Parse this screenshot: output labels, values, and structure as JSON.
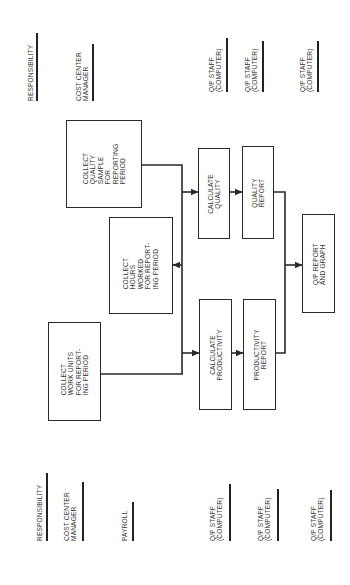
{
  "orientation": "rotated-90-ccw",
  "colors": {
    "line": "#2a2a2a",
    "text": "#333333",
    "background": "#ffffff"
  },
  "top_labels": {
    "responsibility": "RESPONSIBILITY",
    "cost_center_manager": "COST CENTER\nMANAGER",
    "qp_staff_1": "Q/P STAFF\n(COMPUTER)",
    "qp_staff_2": "Q/P STAFF\n(COMPUTER)",
    "qp_staff_3": "Q/P STAFF\n(COMPUTER)"
  },
  "bottom_labels": {
    "responsibility": "RESPONSIBILITY",
    "cost_center_manager": "COST CENTER\nMANAGER",
    "payroll": "PAYROLL",
    "qp_staff_1": "Q/P STAFF\n(COMPUTER)",
    "qp_staff_2": "Q/P STAFF\n(COMPUTER)",
    "qp_staff_3": "Q/P STAFF\n(COMPUTER)"
  },
  "boxes": {
    "collect_quality_sample": "COLLECT\nQUALITY\nSAMPLE\nFOR\nREPORTING\nPERIOD",
    "collect_hours_worked": "COLLECT\nHOURS\nWORKED\nFOR REPORT-\nING PERIOD",
    "collect_work_units": "COLLECT\nWORK UNITS\nFOR REPORT-\nING PERIOD",
    "calculate_quality": "CALCULATE\nQUALITY",
    "quality_report": "QUALITY\nREPORT",
    "calculate_productivity": "CALCULATE\nPRODUCTIVITY",
    "productivity_report": "PRODUCTIVITY\nREPORT",
    "qp_report_and_graph": "Q/P REPORT\nAND GRAPH"
  }
}
